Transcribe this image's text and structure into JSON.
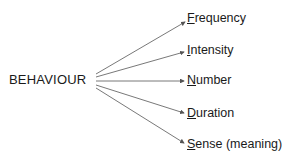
{
  "diagram": {
    "root": "BEHAVIOUR",
    "branches": [
      {
        "initial": "F",
        "rest": "requency",
        "label": "Frequency"
      },
      {
        "initial": "I",
        "rest": "ntensity",
        "label": "Intensity"
      },
      {
        "initial": "N",
        "rest": "umber",
        "label": "Number"
      },
      {
        "initial": "D",
        "rest": "uration",
        "label": "Duration"
      },
      {
        "initial": "S",
        "rest": "ense (meaning)",
        "label": "Sense (meaning)"
      }
    ],
    "line_color": "#555555",
    "text_color": "#1a1a1a"
  }
}
